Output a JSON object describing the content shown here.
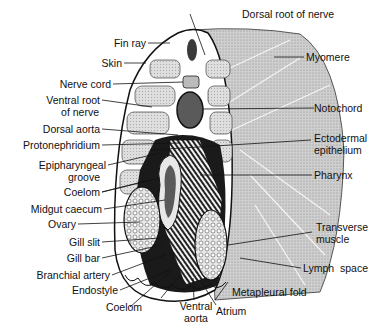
{
  "labels": {
    "left": [
      {
        "id": "fin-ray",
        "text": "Fin ray"
      },
      {
        "id": "skin",
        "text": "Skin"
      },
      {
        "id": "nerve-cord",
        "text": "Nerve cord"
      },
      {
        "id": "ventral-root-of-nerve",
        "text": "Ventral root\nof nerve",
        "line1": "Ventral root",
        "line2": "of nerve"
      },
      {
        "id": "dorsal-aorta",
        "text": "Dorsal aorta"
      },
      {
        "id": "protonephridium",
        "text": "Protonephridium"
      },
      {
        "id": "epipharyngeal-groove",
        "text": "Epipharyngeal groove",
        "line1": "Epipharyngeal",
        "line2": "groove"
      },
      {
        "id": "coelom-upper",
        "text": "Coelom"
      },
      {
        "id": "midgut-caecum",
        "text": "Midgut caecum"
      },
      {
        "id": "ovary",
        "text": "Ovary"
      },
      {
        "id": "gill-slit",
        "text": "Gill slit"
      },
      {
        "id": "gill-bar",
        "text": "Gill bar"
      },
      {
        "id": "branchial-artery",
        "text": "Branchial artery"
      },
      {
        "id": "endostyle",
        "text": "Endostyle"
      },
      {
        "id": "coelom-lower",
        "text": "Coelom"
      }
    ],
    "right": [
      {
        "id": "dorsal-root-of-nerve",
        "text": "Dorsal root of nerve"
      },
      {
        "id": "myomere",
        "text": "Myomere"
      },
      {
        "id": "notochord",
        "text": "Notochord"
      },
      {
        "id": "ectodermal-epithelium",
        "text": "Ectodermal epithelium",
        "line1": "Ectodermal",
        "line2": "epithelium"
      },
      {
        "id": "pharynx",
        "text": "Pharynx"
      },
      {
        "id": "transverse-muscle",
        "text": "Transverse muscle",
        "line1": "Transverse",
        "line2": "muscle"
      },
      {
        "id": "lymph-space",
        "text": "Lymph  space"
      },
      {
        "id": "metapleural-fold",
        "text": "Metapleural fold"
      }
    ],
    "bottom": [
      {
        "id": "ventral-aorta",
        "text": "Ventral aorta",
        "line1": "Ventral",
        "line2": "aorta"
      },
      {
        "id": "atrium",
        "text": "Atrium"
      }
    ]
  },
  "colors": {
    "background": "#ffffff",
    "ink": "#111111",
    "muscle_stipple": "#b8b8b8",
    "muscle_light": "#d2d2d2",
    "dark_tissue": "#1a1a1a",
    "notochord": "#5a5a5a"
  }
}
